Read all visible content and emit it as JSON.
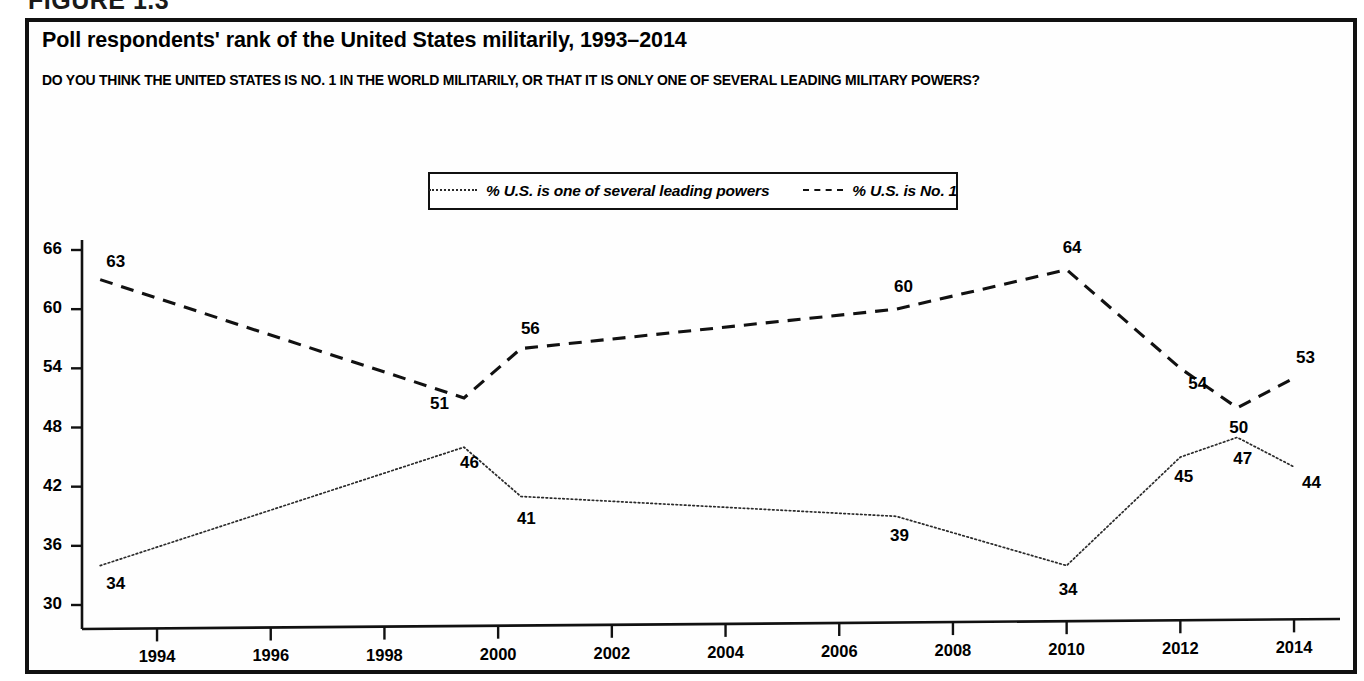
{
  "figure": {
    "label": "FIGURE 1.3"
  },
  "chart_panel": {
    "title": "Poll respondents' rank of the United States militarily, 1993–2014",
    "subtitle": "DO YOU THINK THE UNITED STATES IS NO. 1 IN THE WORLD MILITARILY, OR THAT IT IS ONLY ONE OF SEVERAL LEADING MILITARY POWERS?"
  },
  "colors": {
    "ink": "#111111",
    "panel_background": "#fefefe",
    "dashed_series": "#111111",
    "dotted_series": "#2b2b2b"
  },
  "chart_data": {
    "type": "line",
    "title": "Poll respondents' rank of the United States militarily, 1993–2014",
    "subtitle": "DO YOU THINK THE UNITED STATES IS NO. 1 IN THE WORLD MILITARILY, OR THAT IT IS ONLY ONE OF SEVERAL LEADING MILITARY POWERS?",
    "xlabel": "",
    "ylabel": "",
    "xlim": [
      1992.9,
      1992.9
    ],
    "ylim": [
      30,
      66
    ],
    "grid": false,
    "legend_position": "top-center",
    "xticks": [
      1994,
      1996,
      1998,
      2000,
      2002,
      2004,
      2006,
      2008,
      2010,
      2012,
      2014
    ],
    "xtick_labels": [
      "1994",
      "1996",
      "1998",
      "2000",
      "2002",
      "2004",
      "2006",
      "2008",
      "2010",
      "2012",
      "2014"
    ],
    "yticks": [
      30,
      36,
      42,
      48,
      54,
      60,
      66
    ],
    "ytick_labels": [
      "30",
      "36",
      "42",
      "48",
      "54",
      "60",
      "66"
    ],
    "series": [
      {
        "name": "% U.S. is one of several leading powers",
        "style": "dotted",
        "x": [
          1993,
          1999.4,
          2000.4,
          2007,
          2010,
          2012,
          2013,
          2014
        ],
        "values": [
          34,
          46,
          41,
          39,
          34,
          45,
          47,
          44
        ],
        "labels": [
          "34",
          "46",
          "41",
          "39",
          "34",
          "45",
          "47",
          "44"
        ]
      },
      {
        "name": "% U.S. is No. 1",
        "style": "dashed",
        "x": [
          1993,
          1999.4,
          2000.4,
          2007,
          2010,
          2012,
          2013,
          2014
        ],
        "values": [
          63,
          51,
          56,
          60,
          64,
          54,
          50,
          53
        ],
        "labels": [
          "63",
          "51",
          "56",
          "60",
          "64",
          "54",
          "50",
          "53"
        ]
      }
    ]
  },
  "legend": {
    "entries": [
      {
        "label": "% U.S. is one of several leading powers",
        "style": "dotted"
      },
      {
        "label": "% U.S. is No. 1",
        "style": "dashed"
      }
    ]
  }
}
